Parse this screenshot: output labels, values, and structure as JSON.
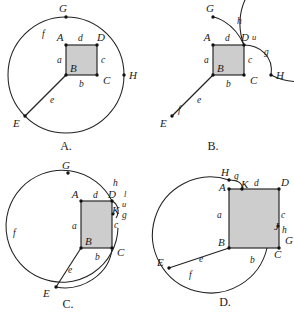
{
  "figure": {
    "shade_color": "#cdcdcd",
    "stroke_color": "#222222",
    "background": "#ffffff"
  },
  "panels": [
    {
      "id": "A",
      "choice_label": "A.",
      "description": "Full circle centered at B with small shaded square ABCD inside and radius e drawn to E",
      "point_labels": [
        "G",
        "A",
        "D",
        "H",
        "B",
        "C",
        "E"
      ],
      "segment_labels": [
        "f",
        "d",
        "a",
        "c",
        "b",
        "e"
      ],
      "labels": {
        "G": "G",
        "A": "A",
        "D": "D",
        "H": "H",
        "B": "B",
        "C": "C",
        "E": "E",
        "f": "f",
        "d": "d",
        "a": "a",
        "c": "c",
        "b": "b",
        "e": "e"
      }
    },
    {
      "id": "B",
      "choice_label": "B.",
      "description": "Circle with arc h from G to D, arc g bulging right past H, arc f near E, square ABCD shaded",
      "point_labels": [
        "G",
        "A",
        "D",
        "H",
        "B",
        "C",
        "E"
      ],
      "segment_labels": [
        "h",
        "u",
        "g",
        "d",
        "a",
        "c",
        "b",
        "e",
        "f"
      ],
      "labels": {
        "G": "G",
        "A": "A",
        "D": "D",
        "H": "H",
        "B": "B",
        "C": "C",
        "E": "E",
        "h": "h",
        "u": "u",
        "g": "g",
        "d": "d",
        "a": "a",
        "c": "c",
        "b": "b",
        "e": "e",
        "f": "f"
      }
    },
    {
      "id": "C",
      "choice_label": "C.",
      "description": "Circle shifted left with shaded square ABCD at right edge, arcs h, l, u, g near D and K",
      "point_labels": [
        "G",
        "A",
        "D",
        "K",
        "B",
        "C",
        "E"
      ],
      "segment_labels": [
        "h",
        "l",
        "u",
        "g",
        "c",
        "d",
        "a",
        "b",
        "e",
        "f"
      ],
      "labels": {
        "G": "G",
        "A": "A",
        "D": "D",
        "K": "K",
        "B": "B",
        "C": "C",
        "E": "E",
        "h": "h",
        "l": "l",
        "u": "u",
        "g": "g",
        "c": "c",
        "d": "d",
        "a": "a",
        "b": "b",
        "e": "e",
        "f": "f"
      }
    },
    {
      "id": "D",
      "choice_label": "D.",
      "description": "Large shaded square ABCD with circle offset left, arcs g near H/K and h near J/G",
      "point_labels": [
        "H",
        "K",
        "D",
        "A",
        "B",
        "C",
        "G",
        "E",
        "J"
      ],
      "segment_labels": [
        "g",
        "d",
        "a",
        "c",
        "h",
        "b",
        "e",
        "f"
      ],
      "labels": {
        "H": "H",
        "K": "K",
        "D": "D",
        "A": "A",
        "B": "B",
        "C": "C",
        "G": "G",
        "E": "E",
        "J": "J",
        "g": "g",
        "d": "d",
        "a": "a",
        "c": "c",
        "h": "h",
        "b": "b",
        "e": "e",
        "f": "f"
      }
    }
  ]
}
